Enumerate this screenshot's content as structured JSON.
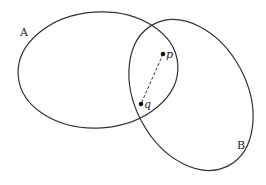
{
  "diagram": {
    "sets": [
      {
        "name": "A",
        "label": "A"
      },
      {
        "name": "B",
        "label": "B"
      }
    ],
    "points": [
      {
        "name": "p",
        "label": "p"
      },
      {
        "name": "q",
        "label": "q"
      }
    ],
    "segment": {
      "from": "p",
      "to": "q",
      "style": "dashed"
    },
    "colors": {
      "stroke": "#333333",
      "background": "#ffffff"
    }
  }
}
